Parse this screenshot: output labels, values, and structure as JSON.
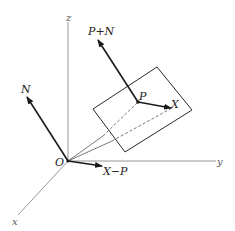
{
  "figure": {
    "colors": {
      "axis": "#8a8a8a",
      "vector": "#1a1a1a",
      "plane_edge": "#2a2a2a",
      "dashed": "#555555",
      "background": "#ffffff"
    },
    "axes": {
      "x_label": "x",
      "y_label": "y",
      "z_label": "z"
    },
    "origin_label": "O",
    "vectors": {
      "n_label": "N",
      "p_plus_n_label": "P+N",
      "x_minus_p_label": "X−P",
      "p_to_x_label": "X"
    },
    "points": {
      "p_label": "P",
      "x_label": "X"
    }
  }
}
